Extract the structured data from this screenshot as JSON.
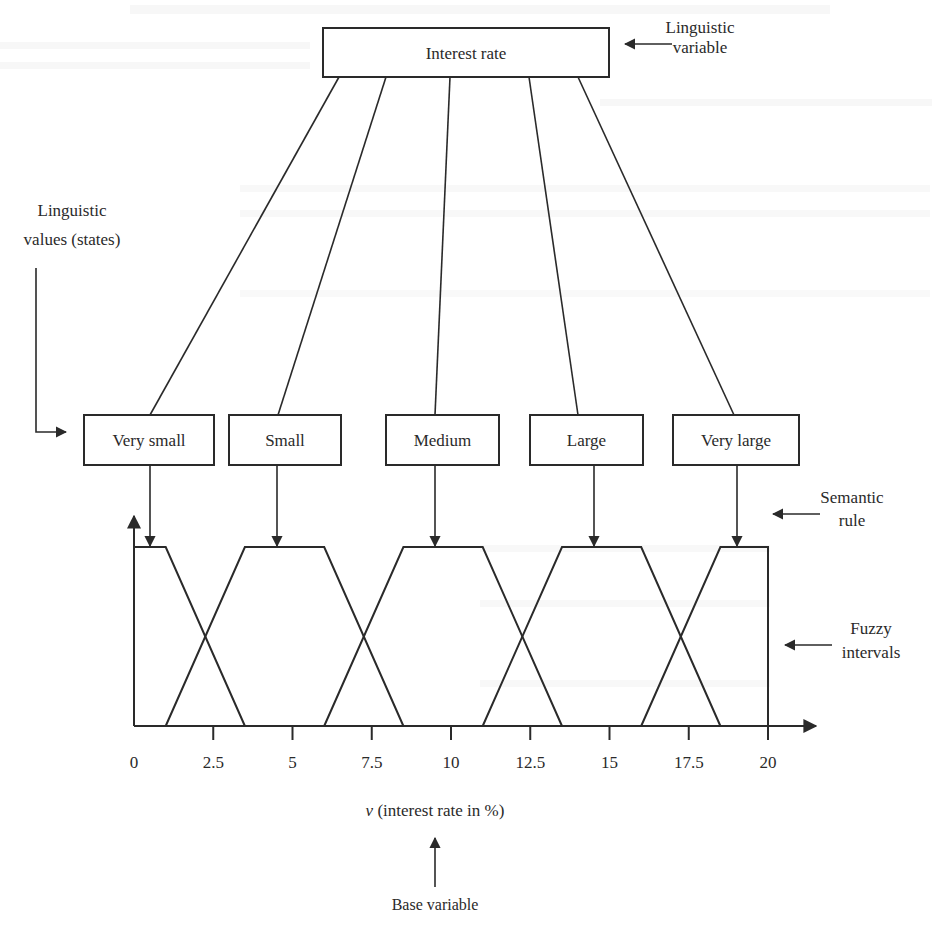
{
  "figure": {
    "root_node": {
      "label": "Interest rate",
      "x": 323,
      "y": 28,
      "w": 286,
      "h": 49
    },
    "annotations": {
      "linguistic_variable": {
        "lines": [
          "Linguistic",
          "variable"
        ],
        "arrow": {
          "x1": 672,
          "y1": 44,
          "x2": 625,
          "y2": 44
        },
        "text_x": 700,
        "text_y": [
          33,
          53
        ]
      },
      "linguistic_values": {
        "lines": [
          "Linguistic",
          "values (states)"
        ],
        "text_x": 72,
        "text_y": [
          216,
          245
        ]
      },
      "semantic_rule": {
        "lines": [
          "Semantic",
          "rule"
        ],
        "arrow": {
          "x1": 820,
          "y1": 514,
          "x2": 773,
          "y2": 514
        },
        "text_x": 852,
        "text_y": [
          503,
          526
        ]
      },
      "fuzzy_intervals": {
        "lines": [
          "Fuzzy",
          "intervals"
        ],
        "arrow": {
          "x1": 832,
          "y1": 645,
          "x2": 785,
          "y2": 645
        },
        "text_x": 871,
        "text_y": [
          634,
          658
        ]
      },
      "base_variable": {
        "label": "Base variable",
        "arrow": {
          "x1": 435,
          "y1": 887,
          "x2": 435,
          "y2": 838
        },
        "text_x": 435,
        "text_y": 910
      }
    },
    "value_nodes": [
      {
        "label": "Very small",
        "x": 84,
        "y": 415,
        "w": 130,
        "h": 50,
        "link_top_x": 339,
        "link_bottom_x": 150,
        "rule_x": 150
      },
      {
        "label": "Small",
        "x": 229,
        "y": 415,
        "w": 112,
        "h": 50,
        "link_top_x": 386,
        "link_bottom_x": 278,
        "rule_x": 277
      },
      {
        "label": "Medium",
        "x": 386,
        "y": 415,
        "w": 113,
        "h": 50,
        "link_top_x": 450,
        "link_bottom_x": 435,
        "rule_x": 435
      },
      {
        "label": "Large",
        "x": 530,
        "y": 415,
        "w": 113,
        "h": 50,
        "link_top_x": 529,
        "link_bottom_x": 578,
        "rule_x": 594
      },
      {
        "label": "Very large",
        "x": 673,
        "y": 415,
        "w": 126,
        "h": 50,
        "link_top_x": 578,
        "link_bottom_x": 734,
        "rule_x": 737
      }
    ],
    "axis_label": "v (interest rate in %)",
    "axis_label_var": "v",
    "axis_label_rest": " (interest rate in %)"
  },
  "chart_data": {
    "type": "line",
    "xlabel": "v (interest rate in %)",
    "ylabel": "",
    "xlim": [
      0,
      21.5
    ],
    "ylim": [
      0,
      1
    ],
    "grid": false,
    "x_ticks": [
      0,
      2.5,
      5,
      7.5,
      10,
      12.5,
      15,
      17.5,
      20
    ],
    "x_tick_labels": [
      "0",
      "2.5",
      "5",
      "7.5",
      "10",
      "12.5",
      "15",
      "17.5",
      "20"
    ],
    "series": [
      {
        "name": "Very small",
        "x": [
          0,
          0,
          1,
          3.5
        ],
        "y": [
          0,
          1,
          1,
          0
        ]
      },
      {
        "name": "Small",
        "x": [
          1,
          3.5,
          6,
          8.5
        ],
        "y": [
          0,
          1,
          1,
          0
        ]
      },
      {
        "name": "Medium",
        "x": [
          6,
          8.5,
          11,
          13.5
        ],
        "y": [
          0,
          1,
          1,
          0
        ]
      },
      {
        "name": "Large",
        "x": [
          11,
          13.5,
          16,
          18.5
        ],
        "y": [
          0,
          1,
          1,
          0
        ]
      },
      {
        "name": "Very large",
        "x": [
          16,
          18.5,
          20,
          20
        ],
        "y": [
          0,
          1,
          1,
          0
        ]
      }
    ],
    "plot_px": {
      "x0": 134,
      "x_per_unit": 31.7,
      "y_base": 726,
      "y_top": 547,
      "y_axis_top": 516,
      "x_axis_end": 816
    }
  }
}
